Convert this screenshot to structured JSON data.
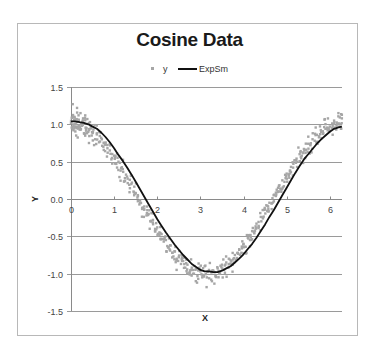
{
  "chart_data": {
    "type": "scatter",
    "title": "Cosine Data",
    "xlabel": "X",
    "ylabel": "Y",
    "xlim": [
      0,
      6.283
    ],
    "ylim": [
      -1.5,
      1.5
    ],
    "xticks": [
      0,
      1,
      2,
      3,
      4,
      5,
      6
    ],
    "yticks": [
      1.5,
      1.0,
      0.5,
      0.0,
      -0.5,
      -1.0,
      -1.5
    ],
    "ytick_labels": [
      "1.5",
      "1.0",
      "0.5",
      "0.0",
      "-0.5",
      "-1.0",
      "-1.5"
    ],
    "xtick_labels": [
      "0",
      "1",
      "2",
      "3",
      "4",
      "5",
      "6"
    ],
    "grid": {
      "horizontal": true,
      "vertical": false
    },
    "legend": {
      "position": "top",
      "entries": [
        "y",
        "ExpSm"
      ]
    },
    "series": [
      {
        "name": "y",
        "kind": "scatter",
        "color": "#a6a6a6",
        "description": "cos(x) with random noise, roughly 600 points across [0, 2π]",
        "points": [
          [
            0.0,
            1.02
          ],
          [
            0.02,
            0.95
          ],
          [
            0.04,
            1.27
          ],
          [
            0.06,
            0.92
          ],
          [
            0.08,
            1.1
          ],
          [
            0.1,
            1.0
          ],
          [
            0.12,
            0.85
          ],
          [
            0.14,
            1.22
          ],
          [
            0.16,
            0.97
          ],
          [
            0.18,
            1.05
          ],
          [
            0.2,
            0.93
          ],
          [
            0.22,
            1.15
          ],
          [
            0.25,
            0.98
          ],
          [
            0.28,
            1.08
          ],
          [
            0.3,
            0.88
          ],
          [
            0.33,
            1.12
          ],
          [
            0.36,
            0.95
          ],
          [
            0.4,
            0.9
          ],
          [
            0.44,
            1.03
          ],
          [
            0.48,
            0.85
          ],
          [
            0.52,
            0.93
          ],
          [
            0.56,
            0.8
          ],
          [
            0.6,
            0.88
          ],
          [
            0.65,
            0.76
          ],
          [
            0.7,
            0.82
          ],
          [
            0.75,
            0.7
          ],
          [
            0.8,
            0.73
          ],
          [
            0.85,
            0.62
          ],
          [
            0.9,
            0.65
          ],
          [
            0.95,
            0.55
          ],
          [
            1.0,
            0.58
          ],
          [
            1.05,
            0.47
          ],
          [
            1.1,
            0.5
          ],
          [
            1.15,
            0.38
          ],
          [
            1.2,
            0.4
          ],
          [
            1.25,
            0.28
          ],
          [
            1.3,
            0.3
          ],
          [
            1.35,
            0.19
          ],
          [
            1.4,
            0.2
          ],
          [
            1.45,
            0.1
          ],
          [
            1.5,
            0.08
          ],
          [
            1.55,
            -0.03
          ],
          [
            1.6,
            -0.02
          ],
          [
            1.65,
            -0.12
          ],
          [
            1.7,
            -0.1
          ],
          [
            1.75,
            -0.22
          ],
          [
            1.8,
            -0.2
          ],
          [
            1.85,
            -0.3
          ],
          [
            1.9,
            -0.28
          ],
          [
            1.95,
            -0.4
          ],
          [
            2.0,
            -0.38
          ],
          [
            2.05,
            -0.48
          ],
          [
            2.1,
            -0.47
          ],
          [
            2.15,
            -0.57
          ],
          [
            2.2,
            -0.55
          ],
          [
            2.25,
            -0.65
          ],
          [
            2.3,
            -0.62
          ],
          [
            2.35,
            -0.72
          ],
          [
            2.4,
            -0.7
          ],
          [
            2.45,
            -0.8
          ],
          [
            2.5,
            -0.78
          ],
          [
            2.55,
            -0.87
          ],
          [
            2.6,
            -0.83
          ],
          [
            2.65,
            -0.92
          ],
          [
            2.7,
            -0.88
          ],
          [
            2.75,
            -0.98
          ],
          [
            2.8,
            -0.92
          ],
          [
            2.85,
            -1.0
          ],
          [
            2.9,
            -0.94
          ],
          [
            2.95,
            -1.07
          ],
          [
            3.0,
            -0.97
          ],
          [
            3.05,
            -1.02
          ],
          [
            3.1,
            -0.9
          ],
          [
            3.15,
            -1.05
          ],
          [
            3.2,
            -0.95
          ],
          [
            3.25,
            -1.08
          ],
          [
            3.3,
            -0.97
          ],
          [
            3.35,
            -1.03
          ],
          [
            3.4,
            -0.93
          ],
          [
            3.45,
            -1.0
          ],
          [
            3.5,
            -0.88
          ],
          [
            3.55,
            -0.95
          ],
          [
            3.6,
            -0.85
          ],
          [
            3.65,
            -0.92
          ],
          [
            3.7,
            -0.82
          ],
          [
            3.75,
            -0.88
          ],
          [
            3.8,
            -0.75
          ],
          [
            3.85,
            -0.8
          ],
          [
            3.9,
            -0.68
          ],
          [
            3.95,
            -0.72
          ],
          [
            4.0,
            -0.6
          ],
          [
            4.05,
            -0.64
          ],
          [
            4.1,
            -0.52
          ],
          [
            4.15,
            -0.55
          ],
          [
            4.2,
            -0.43
          ],
          [
            4.25,
            -0.46
          ],
          [
            4.3,
            -0.33
          ],
          [
            4.35,
            -0.36
          ],
          [
            4.4,
            -0.24
          ],
          [
            4.45,
            -0.26
          ],
          [
            4.5,
            -0.14
          ],
          [
            4.55,
            -0.16
          ],
          [
            4.6,
            -0.05
          ],
          [
            4.65,
            -0.06
          ],
          [
            4.7,
            0.05
          ],
          [
            4.75,
            0.04
          ],
          [
            4.8,
            0.15
          ],
          [
            4.85,
            0.14
          ],
          [
            4.9,
            0.25
          ],
          [
            4.95,
            0.23
          ],
          [
            5.0,
            0.34
          ],
          [
            5.05,
            0.33
          ],
          [
            5.1,
            0.43
          ],
          [
            5.15,
            0.42
          ],
          [
            5.2,
            0.52
          ],
          [
            5.25,
            0.5
          ],
          [
            5.3,
            0.6
          ],
          [
            5.35,
            0.58
          ],
          [
            5.4,
            0.67
          ],
          [
            5.45,
            0.66
          ],
          [
            5.5,
            0.74
          ],
          [
            5.55,
            0.72
          ],
          [
            5.6,
            0.8
          ],
          [
            5.65,
            0.78
          ],
          [
            5.7,
            0.86
          ],
          [
            5.75,
            0.84
          ],
          [
            5.8,
            0.9
          ],
          [
            5.85,
            0.88
          ],
          [
            5.9,
            0.94
          ],
          [
            5.95,
            0.92
          ],
          [
            6.0,
            0.97
          ],
          [
            6.05,
            0.95
          ],
          [
            6.1,
            1.05
          ],
          [
            6.15,
            0.93
          ],
          [
            6.2,
            1.15
          ],
          [
            6.25,
            1.0
          ],
          [
            6.28,
            1.08
          ]
        ]
      },
      {
        "name": "ExpSm",
        "kind": "line",
        "color": "#111111",
        "points": [
          [
            0.0,
            1.04
          ],
          [
            0.1,
            1.04
          ],
          [
            0.2,
            1.03
          ],
          [
            0.3,
            1.02
          ],
          [
            0.4,
            1.0
          ],
          [
            0.5,
            0.97
          ],
          [
            0.6,
            0.94
          ],
          [
            0.7,
            0.89
          ],
          [
            0.8,
            0.83
          ],
          [
            0.9,
            0.76
          ],
          [
            1.0,
            0.68
          ],
          [
            1.1,
            0.59
          ],
          [
            1.2,
            0.51
          ],
          [
            1.3,
            0.42
          ],
          [
            1.4,
            0.33
          ],
          [
            1.5,
            0.23
          ],
          [
            1.6,
            0.13
          ],
          [
            1.7,
            0.03
          ],
          [
            1.8,
            -0.07
          ],
          [
            1.9,
            -0.17
          ],
          [
            2.0,
            -0.27
          ],
          [
            2.1,
            -0.36
          ],
          [
            2.2,
            -0.45
          ],
          [
            2.3,
            -0.53
          ],
          [
            2.4,
            -0.61
          ],
          [
            2.5,
            -0.68
          ],
          [
            2.6,
            -0.75
          ],
          [
            2.7,
            -0.81
          ],
          [
            2.8,
            -0.87
          ],
          [
            2.9,
            -0.91
          ],
          [
            3.0,
            -0.95
          ],
          [
            3.1,
            -0.97
          ],
          [
            3.2,
            -0.97
          ],
          [
            3.3,
            -0.98
          ],
          [
            3.4,
            -0.98
          ],
          [
            3.5,
            -0.96
          ],
          [
            3.6,
            -0.93
          ],
          [
            3.7,
            -0.9
          ],
          [
            3.8,
            -0.85
          ],
          [
            3.9,
            -0.8
          ],
          [
            4.0,
            -0.74
          ],
          [
            4.1,
            -0.67
          ],
          [
            4.2,
            -0.6
          ],
          [
            4.3,
            -0.52
          ],
          [
            4.4,
            -0.43
          ],
          [
            4.5,
            -0.34
          ],
          [
            4.6,
            -0.24
          ],
          [
            4.7,
            -0.15
          ],
          [
            4.8,
            -0.05
          ],
          [
            4.9,
            0.05
          ],
          [
            5.0,
            0.15
          ],
          [
            5.1,
            0.25
          ],
          [
            5.2,
            0.35
          ],
          [
            5.3,
            0.44
          ],
          [
            5.4,
            0.53
          ],
          [
            5.5,
            0.6
          ],
          [
            5.6,
            0.67
          ],
          [
            5.7,
            0.74
          ],
          [
            5.8,
            0.8
          ],
          [
            5.9,
            0.85
          ],
          [
            6.0,
            0.9
          ],
          [
            6.1,
            0.94
          ],
          [
            6.2,
            0.96
          ],
          [
            6.28,
            0.97
          ]
        ]
      }
    ]
  },
  "legend": {
    "y_label": "y",
    "expsm_label": "ExpSm"
  },
  "title": "Cosine Data"
}
